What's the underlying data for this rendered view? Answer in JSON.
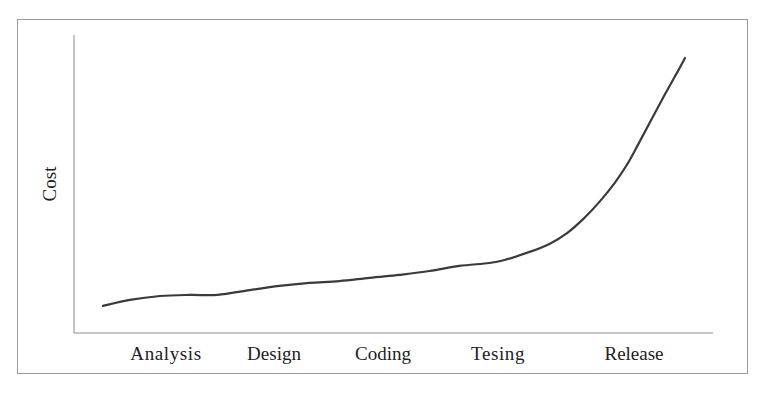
{
  "chart_data": {
    "type": "line",
    "title": "",
    "xlabel": "",
    "ylabel": "Cost",
    "categories": [
      "Analysis",
      "Design",
      "Coding",
      "Tesing",
      "Release"
    ],
    "series": [
      {
        "name": "Cost",
        "values": [
          12.4,
          15.4,
          18.8,
          23.8,
          59.0
        ]
      }
    ],
    "curve_points_normalized": [
      [
        0.0,
        9.1
      ],
      [
        0.046,
        11.1
      ],
      [
        0.098,
        12.4
      ],
      [
        0.149,
        12.8
      ],
      [
        0.197,
        12.8
      ],
      [
        0.252,
        14.4
      ],
      [
        0.303,
        15.8
      ],
      [
        0.355,
        16.8
      ],
      [
        0.406,
        17.4
      ],
      [
        0.458,
        18.5
      ],
      [
        0.509,
        19.5
      ],
      [
        0.561,
        20.8
      ],
      [
        0.612,
        22.5
      ],
      [
        0.664,
        23.5
      ],
      [
        0.69,
        24.5
      ],
      [
        0.733,
        27.2
      ],
      [
        0.767,
        29.9
      ],
      [
        0.798,
        33.6
      ],
      [
        0.827,
        38.6
      ],
      [
        0.853,
        44.0
      ],
      [
        0.879,
        50.3
      ],
      [
        0.901,
        56.7
      ],
      [
        0.921,
        63.8
      ],
      [
        0.942,
        71.5
      ],
      [
        0.964,
        79.5
      ],
      [
        0.983,
        86.2
      ],
      [
        1.0,
        92.3
      ]
    ],
    "ylim": [
      0,
      100
    ],
    "grid": false,
    "legend": "none",
    "y_ticks": "none"
  },
  "colors": {
    "line": "#3a3a3a",
    "axis": "#8c8c8c",
    "frame": "#9a9a9a",
    "text": "#222222",
    "background": "#ffffff"
  },
  "labels": {
    "y_axis": "Cost",
    "x_ticks": [
      "Analysis",
      "Design",
      "Coding",
      "Tesing",
      "Release"
    ]
  }
}
